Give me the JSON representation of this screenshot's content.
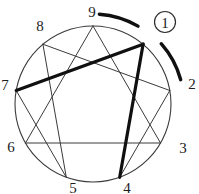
{
  "diagram": {
    "type": "enneagram",
    "colors": {
      "background": "#ffffff",
      "thin_line": "#3a3a3a",
      "circle_outline": "#3a3a3a",
      "thick_line": "#101010",
      "arc": "#101010",
      "text": "#1c1c1c",
      "badge_outline": "#2e2e2e"
    },
    "points": [
      {
        "label": "9",
        "angle": 0,
        "circled": false
      },
      {
        "label": "1",
        "angle": 40,
        "circled": true
      },
      {
        "label": "2",
        "angle": 80,
        "circled": false
      },
      {
        "label": "3",
        "angle": 120,
        "circled": false
      },
      {
        "label": "4",
        "angle": 160,
        "circled": false
      },
      {
        "label": "5",
        "angle": 200,
        "circled": false
      },
      {
        "label": "6",
        "angle": 240,
        "circled": false
      },
      {
        "label": "7",
        "angle": 280,
        "circled": false
      },
      {
        "label": "8",
        "angle": 320,
        "circled": false
      }
    ],
    "connections": [
      {
        "from": "9",
        "to": "3",
        "weight": "thin"
      },
      {
        "from": "3",
        "to": "6",
        "weight": "thin"
      },
      {
        "from": "6",
        "to": "9",
        "weight": "thin"
      },
      {
        "from": "2",
        "to": "8",
        "weight": "thin"
      },
      {
        "from": "8",
        "to": "5",
        "weight": "thin"
      },
      {
        "from": "5",
        "to": "7",
        "weight": "thin"
      },
      {
        "from": "4",
        "to": "2",
        "weight": "thin"
      },
      {
        "from": "1",
        "to": "7",
        "weight": "thick"
      },
      {
        "from": "1",
        "to": "4",
        "weight": "thick"
      }
    ],
    "wing_arcs": [
      {
        "from": "9",
        "to": "1"
      },
      {
        "from": "1",
        "to": "2"
      }
    ]
  }
}
